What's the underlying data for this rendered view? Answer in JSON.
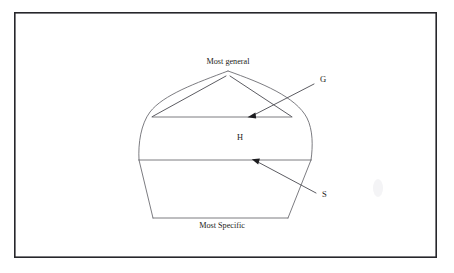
{
  "figure": {
    "kind": "version-space-diagram",
    "background_color": "#ffffff",
    "frame": {
      "border_color": "#26262b",
      "x": 14,
      "y": 12,
      "width": 423,
      "height": 246
    },
    "line_color": "#6d6d73",
    "leader_color": "#4a4a50",
    "text_color": "#1d1d20",
    "labels": {
      "top": "Most general",
      "bottom": "Most Specific",
      "general_boundary": "G",
      "specific_boundary": "S",
      "hypothesis_space": "H"
    },
    "geometry": {
      "apex": {
        "x": 228,
        "y": 71
      },
      "general_line": {
        "x1": 152,
        "y1": 117,
        "x2": 292,
        "y2": 117
      },
      "specific_line": {
        "x1": 139,
        "y1": 160,
        "x2": 311,
        "y2": 160
      },
      "bottom_line": {
        "x1": 153,
        "y1": 218,
        "x2": 288,
        "y2": 218
      },
      "left_arc_bottom": {
        "x": 139,
        "y": 160
      },
      "right_arc_bottom": {
        "x": 311,
        "y": 160
      }
    },
    "annotations": [
      {
        "name": "general-boundary-leader",
        "label": "G",
        "label_x": 320,
        "label_y": 81,
        "from": {
          "x": 314,
          "y": 84
        },
        "to": {
          "x": 249,
          "y": 117
        }
      },
      {
        "name": "specific-boundary-leader",
        "label": "S",
        "label_x": 322,
        "label_y": 196,
        "from": {
          "x": 316,
          "y": 193
        },
        "to": {
          "x": 253,
          "y": 160
        }
      },
      {
        "name": "most-general-leader-left",
        "from": {
          "x": 226,
          "y": 75
        },
        "to": {
          "x": 152,
          "y": 117
        }
      },
      {
        "name": "most-general-leader-right",
        "from": {
          "x": 230,
          "y": 75
        },
        "to": {
          "x": 292,
          "y": 117
        }
      }
    ]
  }
}
